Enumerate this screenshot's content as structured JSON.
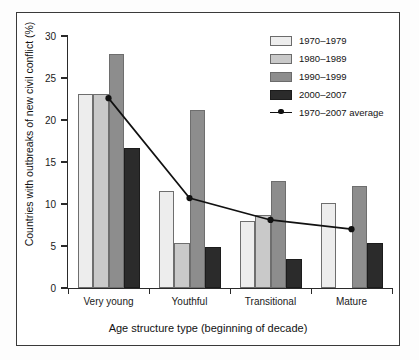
{
  "chart_data": {
    "type": "bar",
    "title": "",
    "xlabel": "Age structure type (beginning of decade)",
    "ylabel": "Countries with outbreaks of new civil conflict (%)",
    "categories": [
      "Very young",
      "Youthful",
      "Transitional",
      "Mature"
    ],
    "ylim": [
      0,
      30
    ],
    "yticks": [
      0,
      5,
      10,
      15,
      20,
      25,
      30
    ],
    "ytick_labels": [
      "0",
      "5",
      "10",
      "15",
      "20",
      "25",
      "30"
    ],
    "grid": false,
    "legend_position": "top-right",
    "series": [
      {
        "name": "1970–1979",
        "type": "bar",
        "color": "#ededed",
        "values": [
          23.1,
          11.6,
          8.0,
          10.1
        ]
      },
      {
        "name": "1980–1989",
        "type": "bar",
        "color": "#c9c9c9",
        "values": [
          23.1,
          5.3,
          8.7,
          0
        ]
      },
      {
        "name": "1990–1999",
        "type": "bar",
        "color": "#8d8d8d",
        "values": [
          27.9,
          21.2,
          12.7,
          12.1
        ]
      },
      {
        "name": "2000–2007",
        "type": "bar",
        "color": "#2b2b2b",
        "values": [
          16.7,
          4.9,
          3.4,
          5.3
        ]
      },
      {
        "name": "1970–2007 average",
        "type": "line",
        "color": "#111111",
        "values": [
          22.6,
          10.7,
          8.1,
          7.0
        ]
      }
    ]
  },
  "legend": {
    "items": [
      {
        "label": "1970–1979",
        "icon": "legend-swatch-1970-1979"
      },
      {
        "label": "1980–1989",
        "icon": "legend-swatch-1980-1989"
      },
      {
        "label": "1990–1999",
        "icon": "legend-swatch-1990-1999"
      },
      {
        "label": "2000–2007",
        "icon": "legend-swatch-2000-2007"
      },
      {
        "label": "1970–2007 average",
        "icon": "legend-line-marker"
      }
    ]
  }
}
